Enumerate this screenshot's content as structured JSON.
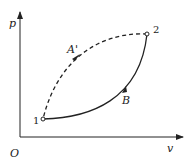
{
  "diagram": {
    "type": "p-v cycle diagram",
    "axes": {
      "y_label": "p",
      "x_label": "v",
      "origin_label": "O"
    },
    "points": [
      {
        "id": "1",
        "label": "1"
      },
      {
        "id": "2",
        "label": "2"
      }
    ],
    "paths": [
      {
        "label": "A'",
        "from": "2",
        "to": "1",
        "style": "dashed",
        "direction": "2→1"
      },
      {
        "label": "B",
        "from": "1",
        "to": "2",
        "style": "solid",
        "direction": "1→2"
      }
    ],
    "colors": {
      "line": "#222222",
      "background": "#ffffff"
    }
  }
}
